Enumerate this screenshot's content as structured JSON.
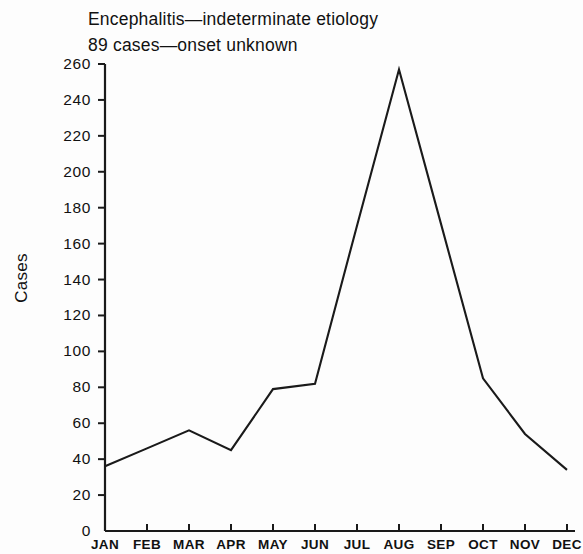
{
  "chart_data": {
    "type": "line",
    "title": "Encephalitis—indeterminate etiology",
    "subtitle": "89 cases—onset unknown",
    "xlabel": "",
    "ylabel": "Cases",
    "categories": [
      "JAN",
      "FEB",
      "MAR",
      "APR",
      "MAY",
      "JUN",
      "JUL",
      "AUG",
      "SEP",
      "OCT",
      "NOV",
      "DEC"
    ],
    "values": [
      36,
      46,
      56,
      45,
      79,
      82,
      170,
      257,
      171,
      85,
      54,
      34
    ],
    "series": [
      {
        "name": "Encephalitis—indeterminate etiology",
        "values": [
          36,
          46,
          56,
          45,
          79,
          82,
          170,
          257,
          171,
          85,
          54,
          34
        ]
      }
    ],
    "ylim": [
      0,
      260
    ],
    "yticks": [
      0,
      20,
      40,
      60,
      80,
      100,
      120,
      140,
      160,
      180,
      200,
      220,
      240,
      260
    ],
    "ytick_labels": [
      "0",
      "20",
      "40",
      "60",
      "80",
      "100",
      "120",
      "140",
      "160",
      "180",
      "200",
      "220",
      "240",
      "260"
    ],
    "grid": false,
    "legend": "none",
    "line_color": "#1a1a1a",
    "axis_color": "#1a1a1a",
    "background_color": "#fdfdfd"
  }
}
